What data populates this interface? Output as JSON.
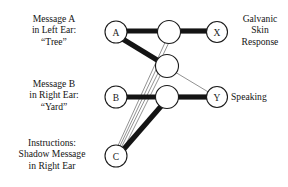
{
  "diagram": {
    "colors": {
      "background": "#ffffff",
      "node_stroke": "#1a1a1a",
      "node_fill": "#ffffff",
      "strong_edge": "#141414",
      "weak_edge": "#6e6e6e"
    },
    "labels": {
      "message_a": {
        "line1": "Message A",
        "line2": "in Left Ear:",
        "line3": "“Tree”"
      },
      "message_b": {
        "line1": "Message B",
        "line2": "in Right Ear:",
        "line3": "“Yard”"
      },
      "instructions": {
        "line1": "Instructions:",
        "line2": "Shadow Message",
        "line3": "in Right Ear"
      },
      "galvanic": {
        "line1": "Galvanic",
        "line2": "Skin",
        "line3": "Response"
      },
      "speaking": {
        "line1": "Speaking"
      }
    },
    "nodes": [
      {
        "id": "A",
        "label": "A",
        "layer": "input",
        "x": 116,
        "y": 32,
        "r": 11
      },
      {
        "id": "B",
        "label": "B",
        "layer": "input",
        "x": 116,
        "y": 97,
        "r": 11
      },
      {
        "id": "C",
        "label": "C",
        "layer": "input",
        "x": 116,
        "y": 156,
        "r": 11
      },
      {
        "id": "H1",
        "label": "",
        "layer": "hidden",
        "x": 169,
        "y": 32,
        "r": 11.5
      },
      {
        "id": "H2",
        "label": "",
        "layer": "hidden",
        "x": 167,
        "y": 66,
        "r": 11.5
      },
      {
        "id": "H3",
        "label": "",
        "layer": "hidden",
        "x": 167,
        "y": 97,
        "r": 11.5
      },
      {
        "id": "X",
        "label": "X",
        "layer": "output",
        "x": 217,
        "y": 32,
        "r": 10.5
      },
      {
        "id": "Y",
        "label": "Y",
        "layer": "output",
        "x": 217,
        "y": 97,
        "r": 10.5
      }
    ],
    "edges": [
      {
        "from": "A",
        "to": "H1",
        "weight": "strong"
      },
      {
        "from": "A",
        "to": "H2",
        "weight": "strong"
      },
      {
        "from": "H1",
        "to": "X",
        "weight": "strong"
      },
      {
        "from": "B",
        "to": "H3",
        "weight": "strong"
      },
      {
        "from": "C",
        "to": "H3",
        "weight": "strong"
      },
      {
        "from": "H3",
        "to": "Y",
        "weight": "strong"
      },
      {
        "from": "C",
        "to": "H1",
        "weight": "weak"
      },
      {
        "from": "C",
        "to": "H2",
        "weight": "weak"
      },
      {
        "from": "C",
        "to": "H2b",
        "weight": "weak"
      },
      {
        "from": "H2",
        "to": "Y",
        "weight": "weak"
      }
    ]
  }
}
